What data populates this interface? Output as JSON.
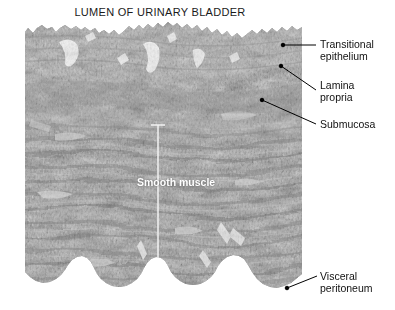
{
  "figure": {
    "title": "LUMEN OF URINARY BLADDER",
    "type": "histology-micrograph",
    "stain_tone": "grayscale"
  },
  "labels": {
    "transitional_epithelium_line1": "Transitional",
    "transitional_epithelium_line2": "epithelium",
    "lamina_propria_line1": "Lamina",
    "lamina_propria_line2": "propria",
    "submucosa": "Submucosa",
    "visceral_peritoneum_line1": "Visceral",
    "visceral_peritoneum_line2": "peritoneum",
    "smooth_muscle": "Smooth muscle"
  },
  "colors": {
    "background": "#ffffff",
    "text": "#111111",
    "leader_line": "#000000",
    "overlay_text": "#ffffff",
    "tissue_mid": "#9a9a9a",
    "tissue_dark": "#6f6f6f",
    "tissue_light": "#c2c2c2",
    "epithelium": "#a8a8a8"
  },
  "annotations": [
    {
      "name": "transitional-epithelium",
      "dot": [
        283,
        45
      ],
      "text_at": [
        320,
        39
      ]
    },
    {
      "name": "lamina-propria",
      "dot": [
        281,
        66
      ],
      "text_at": [
        320,
        80
      ]
    },
    {
      "name": "submucosa",
      "dot": [
        262,
        100
      ],
      "text_at": [
        320,
        118
      ]
    },
    {
      "name": "visceral-peritoneum",
      "dot": [
        287,
        288
      ],
      "text_at": [
        320,
        271
      ]
    }
  ],
  "bracket": {
    "name": "smooth-muscle-bracket",
    "x": 158,
    "top": 125,
    "bottom": 258
  }
}
